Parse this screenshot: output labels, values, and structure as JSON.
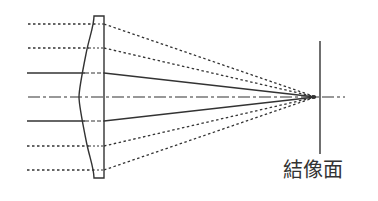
{
  "diagram": {
    "labels": {
      "image_plane": "結像面"
    },
    "colors": {
      "stroke": "#333333",
      "background": "#ffffff"
    },
    "lens": {
      "type": "aspheric plano-convex",
      "flat_face_x": 104,
      "top_y": 16,
      "bottom_y": 178
    },
    "optical_axis_y": 97,
    "focal_point": {
      "x": 316,
      "y": 97
    },
    "image_plane": {
      "x": 320,
      "top_y": 41,
      "bottom_y": 154
    },
    "rays": [
      {
        "y": 24,
        "style": "dotted"
      },
      {
        "y": 48,
        "style": "dotted"
      },
      {
        "y": 73,
        "style": "solid"
      },
      {
        "y": 121,
        "style": "solid"
      },
      {
        "y": 146,
        "style": "dotted"
      },
      {
        "y": 170,
        "style": "dotted"
      }
    ]
  }
}
